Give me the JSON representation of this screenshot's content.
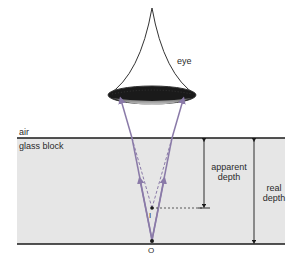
{
  "diagram": {
    "type": "optics-apparent-depth",
    "labels": {
      "eye": "eye",
      "air": "air",
      "glass_block": "glass block",
      "apparent_depth_line1": "apparent",
      "apparent_depth_line2": "depth",
      "real_depth_line1": "real",
      "real_depth_line2": "depth",
      "image_point": "I",
      "object_point": "O"
    },
    "colors": {
      "glass_fill": "#e6e6e6",
      "boundary_line": "#1a1a1a",
      "ray_color": "#8a7aa8",
      "dashed_ray_color": "#8a7aa8",
      "eye_outline": "#333333",
      "pupil": "#1a1a1a",
      "lens_gray": "#7a7a7a",
      "text": "#2a2a2a"
    }
  }
}
